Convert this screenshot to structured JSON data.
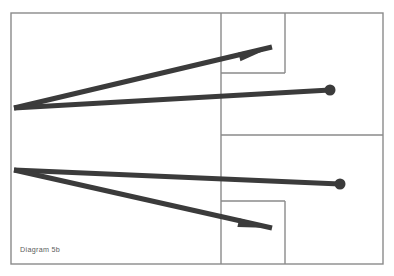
{
  "figure": {
    "caption": "Diagram 5b",
    "background_color": "#ffffff",
    "frame_color": "#8a8a8a",
    "ray_color": "#3b3b3b"
  },
  "chart_data": {
    "type": "diagram",
    "title": "Diagram 5b",
    "xlabel": "",
    "ylabel": "",
    "xlim": [
      0,
      394
    ],
    "ylim": [
      0,
      276
    ],
    "grid": false,
    "legend": "none",
    "frame": {
      "outer_rect": {
        "x": 11,
        "y": 13,
        "width": 372,
        "height": 251
      },
      "dividers": [
        {
          "name": "vertical-divider-main",
          "x1": 221,
          "y1": 13,
          "x2": 221,
          "y2": 264
        },
        {
          "name": "vertical-divider-upper-right",
          "x1": 285,
          "y1": 13,
          "x2": 285,
          "y2": 73
        },
        {
          "name": "horizontal-divider-upper",
          "x1": 221,
          "y1": 73,
          "x2": 285,
          "y2": 73
        },
        {
          "name": "horizontal-divider-middle",
          "x1": 221,
          "y1": 135,
          "x2": 383,
          "y2": 135
        },
        {
          "name": "horizontal-divider-lower",
          "x1": 221,
          "y1": 201,
          "x2": 285,
          "y2": 201
        },
        {
          "name": "vertical-divider-lower-right",
          "x1": 285,
          "y1": 201,
          "x2": 285,
          "y2": 264
        }
      ]
    },
    "series": [
      {
        "name": "ray-path-upper",
        "vertex": [
          14,
          108
        ],
        "branches": [
          {
            "name": "upper-arrow-branch",
            "points": [
              [
                14,
                108
              ],
              [
                272,
                47
              ]
            ],
            "terminator": "arrowhead",
            "terminator_point": [
              272,
              47
            ]
          },
          {
            "name": "upper-dot-branch",
            "points": [
              [
                14,
                108
              ],
              [
                330,
                90
              ]
            ],
            "terminator": "circle",
            "terminator_point": [
              330,
              90
            ]
          }
        ]
      },
      {
        "name": "ray-path-lower",
        "vertex": [
          14,
          170
        ],
        "branches": [
          {
            "name": "lower-dot-branch",
            "points": [
              [
                14,
                170
              ],
              [
                340,
                184
              ]
            ],
            "terminator": "circle",
            "terminator_point": [
              340,
              184
            ]
          },
          {
            "name": "lower-arrow-branch",
            "points": [
              [
                14,
                170
              ],
              [
                272,
                228
              ]
            ],
            "terminator": "arrowhead",
            "terminator_point": [
              272,
              228
            ]
          }
        ]
      }
    ],
    "crossing_point": [
      139,
      140
    ],
    "endpoint_markers": [
      {
        "type": "arrowhead",
        "x": 272,
        "y": 47,
        "direction": "up-right"
      },
      {
        "type": "circle",
        "x": 330,
        "y": 90,
        "radius": 5.5
      },
      {
        "type": "circle",
        "x": 340,
        "y": 184,
        "radius": 5.5
      },
      {
        "type": "arrowhead",
        "x": 272,
        "y": 228,
        "direction": "down-right"
      }
    ]
  }
}
